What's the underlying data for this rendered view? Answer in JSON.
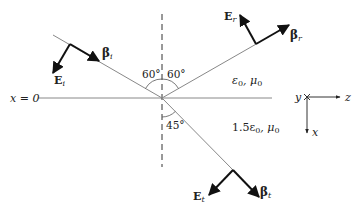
{
  "diagram": {
    "boundary_label": "x = 0",
    "incident": {
      "E_label": "E",
      "E_sub": "i",
      "beta_label": "β",
      "beta_sub": "i",
      "angle": "60°"
    },
    "reflected": {
      "E_label": "E",
      "E_sub": "r",
      "beta_label": "β",
      "beta_sub": "r",
      "angle": "60°"
    },
    "transmitted": {
      "E_label": "E",
      "E_sub": "t",
      "beta_label": "β",
      "beta_sub": "t",
      "angle": "45°"
    },
    "media": {
      "upper": "ε0, μ0",
      "upper_main": "ε",
      "upper_sub1": "0",
      "upper_mid": ", μ",
      "upper_sub2": "0",
      "lower_main": "1.5ε",
      "lower_sub1": "0",
      "lower_mid": ", μ",
      "lower_sub2": "0"
    },
    "axes": {
      "y": "y",
      "z": "z",
      "x": "x"
    },
    "colors": {
      "line": "#888888",
      "arrow": "#111111",
      "text": "#222222"
    }
  }
}
